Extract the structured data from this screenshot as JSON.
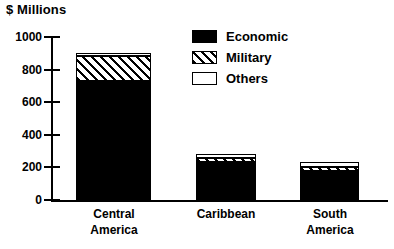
{
  "chart_data": {
    "type": "bar",
    "title": "$ Millions",
    "xlabel": "",
    "ylabel": "$ Millions",
    "stacked": true,
    "grid": false,
    "legend_position": "top-right",
    "ylim": [
      0,
      1000
    ],
    "yticks": [
      0,
      200,
      400,
      600,
      800,
      1000
    ],
    "ytick_labels": [
      "0",
      "200",
      "400",
      "600",
      "800",
      "1000"
    ],
    "categories": [
      "Central America",
      "Caribbean",
      "South America"
    ],
    "category_lines": [
      [
        "Central",
        "America"
      ],
      [
        "Caribbean",
        ""
      ],
      [
        "South",
        "America"
      ]
    ],
    "series": [
      {
        "name": "Economic",
        "pattern": "solid-black",
        "color": "#000000",
        "values": [
          730,
          235,
          180
        ]
      },
      {
        "name": "Military",
        "pattern": "diagonal-hatch",
        "color": "#000000",
        "values": [
          155,
          25,
          20
        ]
      },
      {
        "name": "Others",
        "pattern": "white-outline",
        "color": "#ffffff",
        "values": [
          20,
          20,
          35
        ]
      }
    ],
    "totals": [
      905,
      280,
      235
    ]
  },
  "legend": {
    "items": [
      {
        "label": "Economic",
        "swatch": "solid-black-swatch"
      },
      {
        "label": "Military",
        "swatch": "diagonal-hatch-swatch"
      },
      {
        "label": "Others",
        "swatch": "white-outline-swatch"
      }
    ]
  },
  "colors": {
    "ink": "#000000",
    "background": "#ffffff"
  }
}
